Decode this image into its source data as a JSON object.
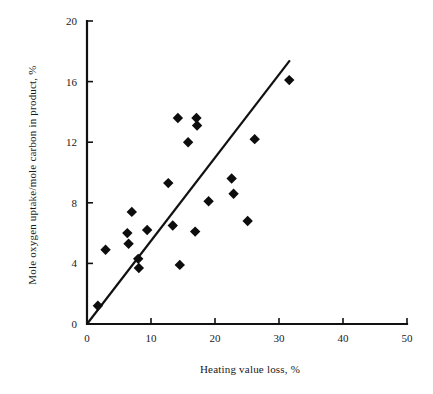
{
  "chart_data": {
    "type": "scatter",
    "title": "",
    "xlabel": "Heating value loss, %",
    "ylabel": "Mole oxygen uptake/mole carbon in product, %",
    "xlim": [
      0,
      50
    ],
    "ylim": [
      0,
      20
    ],
    "xticks": [
      0,
      10,
      20,
      30,
      40,
      50
    ],
    "yticks": [
      0,
      4,
      8,
      12,
      16,
      20
    ],
    "xtick_labels": [
      "0",
      "10",
      "20",
      "30",
      "40",
      "50"
    ],
    "ytick_labels": [
      "0",
      "4",
      "8",
      "12",
      "16",
      "20"
    ],
    "grid": false,
    "legend": null,
    "marker": "filled-diamond",
    "marker_color": "#0d0d0d",
    "points": [
      {
        "x": 1.7,
        "y": 1.2
      },
      {
        "x": 2.9,
        "y": 4.9
      },
      {
        "x": 6.3,
        "y": 6.0
      },
      {
        "x": 6.5,
        "y": 5.3
      },
      {
        "x": 7.0,
        "y": 7.4
      },
      {
        "x": 8.0,
        "y": 4.3
      },
      {
        "x": 8.1,
        "y": 3.7
      },
      {
        "x": 9.4,
        "y": 6.2
      },
      {
        "x": 12.7,
        "y": 9.3
      },
      {
        "x": 13.4,
        "y": 6.5
      },
      {
        "x": 14.2,
        "y": 13.6
      },
      {
        "x": 14.5,
        "y": 3.9
      },
      {
        "x": 15.8,
        "y": 12.0
      },
      {
        "x": 16.9,
        "y": 6.1
      },
      {
        "x": 17.1,
        "y": 13.6
      },
      {
        "x": 17.2,
        "y": 13.1
      },
      {
        "x": 19.0,
        "y": 8.1
      },
      {
        "x": 22.6,
        "y": 9.6
      },
      {
        "x": 22.9,
        "y": 8.6
      },
      {
        "x": 25.1,
        "y": 6.8
      },
      {
        "x": 26.2,
        "y": 12.2
      },
      {
        "x": 31.6,
        "y": 16.1
      }
    ],
    "fit_line": {
      "type": "linear",
      "x_start": 0.0,
      "y_start": 0.0,
      "x_end": 31.7,
      "y_end": 17.4,
      "slope": 0.549,
      "intercept": 0.0
    }
  },
  "axes": {
    "x_axis_name": "x-axis",
    "y_axis_name": "y-axis"
  }
}
